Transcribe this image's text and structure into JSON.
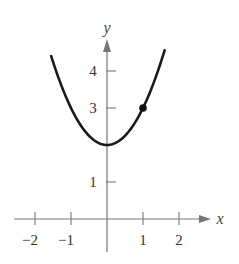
{
  "chart_data": {
    "type": "line",
    "title": "",
    "function": "y = x^2 + 2",
    "xlabel": "x",
    "ylabel": "y",
    "xlim": [
      -2.6,
      2.8
    ],
    "ylim": [
      0,
      4.6
    ],
    "x_ticks": [
      -2,
      -1,
      1,
      2
    ],
    "x_tick_labels": [
      "−2",
      "−1",
      "1",
      "2"
    ],
    "y_ticks": [
      1,
      3,
      4
    ],
    "y_tick_labels": [
      "1",
      "3",
      "4"
    ],
    "grid": false,
    "legend": null,
    "series": [
      {
        "name": "y = x^2 + 2",
        "x": [
          -1.55,
          -1.5,
          -1.0,
          -0.5,
          0,
          0.5,
          1.0,
          1.5,
          1.6
        ],
        "y": [
          4.4,
          4.25,
          3.0,
          2.25,
          2.0,
          2.25,
          3.0,
          4.25,
          4.56
        ],
        "x_range": [
          -1.55,
          1.6
        ],
        "color": "#1a1a1a"
      }
    ],
    "points": [
      {
        "x": 1,
        "y": 3,
        "marker": "filled-circle"
      }
    ],
    "axis_color": "#777777"
  }
}
